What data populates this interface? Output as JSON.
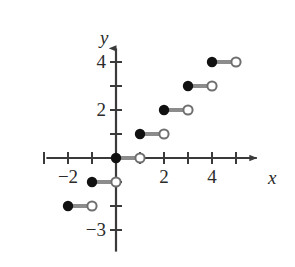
{
  "figure": {
    "title": "",
    "background_color": "#ffffff"
  },
  "chart_data": {
    "type": "line",
    "subtype": "step-function",
    "title": "",
    "xlabel": "x",
    "ylabel": "y",
    "xlim": [
      -2.9,
      6.2
    ],
    "ylim": [
      -3.9,
      4.9
    ],
    "grid": false,
    "legend": false,
    "axis_arrows": true,
    "x_ticks": [
      -3,
      -2,
      -1,
      1,
      2,
      3,
      4,
      5
    ],
    "x_tick_labels": [
      {
        "value": -2,
        "text": "−2"
      },
      {
        "value": 2,
        "text": "2"
      },
      {
        "value": 4,
        "text": "4"
      }
    ],
    "y_ticks": [
      -3,
      -2,
      -1,
      1,
      2,
      3,
      4
    ],
    "y_tick_labels": [
      {
        "value": 4,
        "text": "4"
      },
      {
        "value": 2,
        "text": "2"
      },
      {
        "value": -3,
        "text": "−3"
      }
    ],
    "segment_color": "#8c8c8c",
    "closed_dot_color": "#111111",
    "open_dot_fill": "#ffffff",
    "open_dot_stroke": "#6f6f6f",
    "axis_color": "#3a3a3a",
    "segments": [
      {
        "x_start": -2,
        "x_end": -1,
        "y": -2,
        "left_endpoint": "closed",
        "right_endpoint": "open"
      },
      {
        "x_start": -1,
        "x_end": 0,
        "y": -1,
        "left_endpoint": "closed",
        "right_endpoint": "open"
      },
      {
        "x_start": 0,
        "x_end": 1,
        "y": 0,
        "left_endpoint": "closed",
        "right_endpoint": "open"
      },
      {
        "x_start": 1,
        "x_end": 2,
        "y": 1,
        "left_endpoint": "closed",
        "right_endpoint": "open"
      },
      {
        "x_start": 2,
        "x_end": 3,
        "y": 2,
        "left_endpoint": "closed",
        "right_endpoint": "open"
      },
      {
        "x_start": 3,
        "x_end": 4,
        "y": 3,
        "left_endpoint": "closed",
        "right_endpoint": "open"
      },
      {
        "x_start": 4,
        "x_end": 5,
        "y": 4,
        "left_endpoint": "closed",
        "right_endpoint": "open"
      }
    ]
  }
}
